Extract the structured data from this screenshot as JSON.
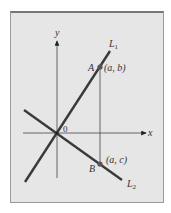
{
  "diagram": {
    "axes": {
      "x_label": "x",
      "y_label": "y",
      "origin_label": "0"
    },
    "lines": [
      {
        "name": "L1",
        "label_main": "L",
        "label_sub": "1",
        "slope": "positive"
      },
      {
        "name": "L2",
        "label_main": "L",
        "label_sub": "2",
        "slope": "negative"
      }
    ],
    "points": [
      {
        "name": "A",
        "coords": "(a, b)",
        "on": "L1"
      },
      {
        "name": "B",
        "coords": "(a, c)",
        "on": "L2"
      }
    ],
    "colors": {
      "background": "#e6e6e6",
      "line": "#3a3a3a",
      "axis": "#444444",
      "point": "#555555"
    }
  }
}
